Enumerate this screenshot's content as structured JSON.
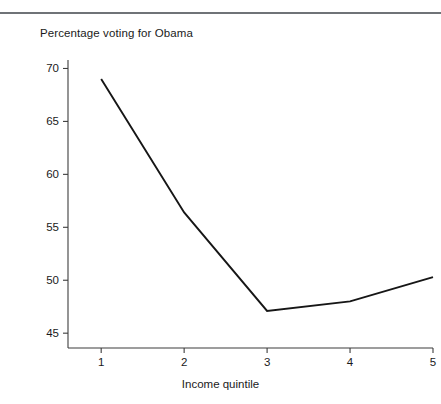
{
  "chart_data": {
    "type": "line",
    "title": "Percentage voting for Obama",
    "xlabel": "Income quintile",
    "ylabel": "",
    "x": [
      1,
      2,
      3,
      4,
      5
    ],
    "categories": [
      "1",
      "2",
      "3",
      "4",
      "5"
    ],
    "values": [
      69.0,
      56.4,
      47.1,
      48.0,
      50.3
    ],
    "series": [
      {
        "name": "Percentage voting for Obama",
        "values": [
          69.0,
          56.4,
          47.1,
          48.0,
          50.3
        ]
      }
    ],
    "xlim": [
      0.6,
      5.0
    ],
    "ylim": [
      43.6,
      70.8
    ],
    "yticks": [
      45,
      50,
      55,
      60,
      65,
      70
    ],
    "ytick_labels": [
      "45",
      "50",
      "55",
      "60",
      "65",
      "70"
    ],
    "xticks": [
      1,
      2,
      3,
      4,
      5
    ],
    "xtick_labels": [
      "1",
      "2",
      "3",
      "4",
      "5"
    ],
    "grid": false,
    "legend": null,
    "line_color": "#161616",
    "axis_color": "#3d3d3d",
    "background_color": "#ffffff"
  },
  "figure": {
    "top_rule_color": "#6f7377"
  }
}
